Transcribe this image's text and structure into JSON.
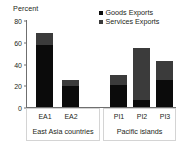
{
  "chart_data": {
    "type": "bar",
    "subtype": "stacked-column",
    "title": "",
    "xlabel": "",
    "ylabel": "Percent",
    "ylim": [
      0,
      80
    ],
    "yticks": [
      0,
      20,
      40,
      60,
      80
    ],
    "ytick_labels": [
      "0",
      "20",
      "40",
      "60",
      "80"
    ],
    "grid": false,
    "legend_position": "top-right",
    "categories": [
      "EA1",
      "EA2",
      "PI1",
      "PI2",
      "PI3"
    ],
    "groups": [
      {
        "name": "East Asia countries",
        "categories": [
          "EA1",
          "EA2"
        ]
      },
      {
        "name": "Pacific islands",
        "categories": [
          "PI1",
          "PI2",
          "PI3"
        ]
      }
    ],
    "series": [
      {
        "name": "Goods Exports",
        "color": "#0b0b0b",
        "values": [
          57,
          19,
          20,
          6,
          25
        ]
      },
      {
        "name": "Services Exports",
        "color": "#3b3b3b",
        "values": [
          11,
          6,
          9,
          48,
          17
        ]
      }
    ],
    "totals": [
      68,
      25,
      29,
      54,
      42
    ]
  },
  "legend": {
    "items": [
      {
        "label": "Goods Exports",
        "swatch": "goods-swatch"
      },
      {
        "label": "Services Exports",
        "swatch": "services-swatch"
      }
    ]
  },
  "axis": {
    "y_title": "Percent",
    "y_ticks": [
      "80",
      "60",
      "40",
      "20",
      "0"
    ]
  },
  "colors": {
    "goods": "#0b0b0b",
    "services": "#3b3b3b",
    "axis": "#6f6f6f",
    "text": "#231f20",
    "box_border": "#d4d4d4",
    "background": "#ffffff"
  }
}
